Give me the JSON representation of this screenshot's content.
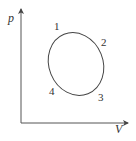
{
  "diagram": {
    "type": "p-V cycle diagram",
    "axes": {
      "y_label": "p",
      "x_label": "V"
    },
    "points": [
      {
        "id": "1",
        "label": "1"
      },
      {
        "id": "2",
        "label": "2"
      },
      {
        "id": "3",
        "label": "3"
      },
      {
        "id": "4",
        "label": "4"
      }
    ],
    "curve": "closed elliptical cycle 1-2-3-4",
    "colors": {
      "line": "#444444",
      "text": "#333333",
      "background": "#ffffff"
    }
  }
}
